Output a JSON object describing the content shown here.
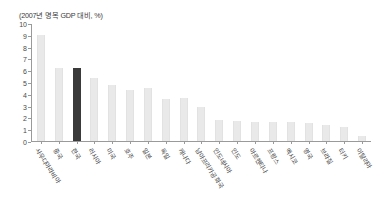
{
  "chart_data": {
    "type": "bar",
    "title": "(2007년 명목 GDP 대비, %)",
    "xlabel": "",
    "ylabel": "",
    "ylim": [
      0,
      10
    ],
    "ytick_labels": [
      "10",
      "9",
      "8",
      "7",
      "6",
      "5",
      "4",
      "3",
      "2",
      "1",
      "0"
    ],
    "ytick_values": [
      10,
      9,
      8,
      7,
      6,
      5,
      4,
      3,
      2,
      1,
      0
    ],
    "grid": false,
    "legend": null,
    "highlight_index": 2,
    "highlight_color": "#3a3a3a",
    "bar_color": "#e9e9e9",
    "categories": [
      "사우디아라비아",
      "중국",
      "한국",
      "러시아",
      "미국",
      "호주",
      "일본",
      "독일",
      "캐나다",
      "남아프리카공화국",
      "인도네시아",
      "인도",
      "아르헨티나",
      "프랑스",
      "멕시코",
      "영국",
      "브라질",
      "터키",
      "이탈리아"
    ],
    "values": [
      9.1,
      6.2,
      6.2,
      5.4,
      4.8,
      4.4,
      4.5,
      3.6,
      3.7,
      2.9,
      1.8,
      1.7,
      1.6,
      1.6,
      1.6,
      1.5,
      1.4,
      1.2,
      0.4
    ]
  }
}
